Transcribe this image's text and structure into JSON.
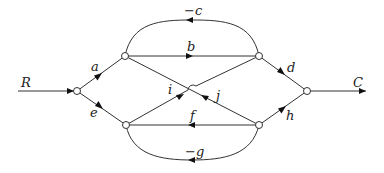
{
  "diagram": {
    "type": "signal-flow-graph",
    "input_label": "R",
    "output_label": "C",
    "nodes": [
      {
        "id": "n1",
        "x": 77,
        "y": 91
      },
      {
        "id": "n2",
        "x": 125,
        "y": 56
      },
      {
        "id": "n3",
        "x": 259,
        "y": 56
      },
      {
        "id": "n4",
        "x": 126,
        "y": 125
      },
      {
        "id": "n5",
        "x": 259,
        "y": 125
      },
      {
        "id": "n6",
        "x": 307,
        "y": 91
      }
    ],
    "edges": [
      {
        "from": "in",
        "to": "n1",
        "label": "R"
      },
      {
        "from": "n1",
        "to": "n2",
        "label": "a"
      },
      {
        "from": "n1",
        "to": "n4",
        "label": "e"
      },
      {
        "from": "n2",
        "to": "n3",
        "label": "b"
      },
      {
        "from": "n3",
        "to": "n2",
        "label": "−c"
      },
      {
        "from": "n5",
        "to": "n4",
        "label": "f"
      },
      {
        "from": "n5",
        "to": "n4",
        "label": "−g"
      },
      {
        "from": "n4",
        "to": "n3",
        "label": "i"
      },
      {
        "from": "n5",
        "to": "n2",
        "label": "j"
      },
      {
        "from": "n3",
        "to": "n6",
        "label": "d"
      },
      {
        "from": "n5",
        "to": "n6",
        "label": "h"
      },
      {
        "from": "n6",
        "to": "out",
        "label": "C"
      }
    ],
    "labels": {
      "R": "R",
      "C": "C",
      "a": "a",
      "b": "b",
      "c": "−c",
      "d": "d",
      "e": "e",
      "f": "f",
      "g": "−g",
      "h": "h",
      "i": "i",
      "j": "j"
    }
  }
}
